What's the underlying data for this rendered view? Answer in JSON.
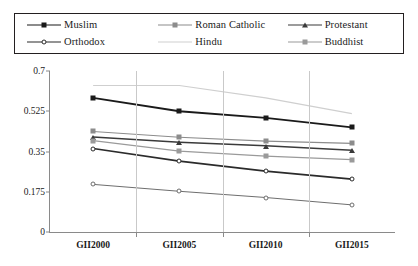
{
  "chart_data": {
    "type": "line",
    "title": "",
    "subtitle": "",
    "xlabel": "",
    "ylabel": "",
    "categories": [
      "GII2000",
      "GII2005",
      "GII2010",
      "GII2015"
    ],
    "ylim": [
      0,
      0.7
    ],
    "yticks": [
      "0",
      "0.175",
      "0.35",
      "0.525",
      "0.7"
    ],
    "ytick_values": [
      0,
      0.175,
      0.35,
      0.525,
      0.7
    ],
    "grid": "vertical-only",
    "legend_position": "top-outside",
    "series": [
      {
        "name": "Muslim",
        "color": "#1a1a1a",
        "marker": "diamond",
        "line_width": 1.9,
        "values": [
          0.583,
          0.525,
          0.496,
          0.455
        ]
      },
      {
        "name": "Roman Catholic",
        "color": "#8c8c8c",
        "marker": "square",
        "line_width": 1.2,
        "values": [
          0.437,
          0.412,
          0.395,
          0.385
        ]
      },
      {
        "name": "Protestant",
        "color": "#3a3a3a",
        "marker": "triangle",
        "line_width": 1.5,
        "values": [
          0.413,
          0.39,
          0.375,
          0.355
        ]
      },
      {
        "name": "Orthodox",
        "color": "#2b2b2b",
        "marker": "circle",
        "line_width": 1.7,
        "values": [
          0.363,
          0.308,
          0.265,
          0.23
        ]
      },
      {
        "name": "Hindu",
        "color": "#cfcfcf",
        "marker": "none",
        "line_width": 1.2,
        "values": [
          0.637,
          0.637,
          0.583,
          0.515
        ]
      },
      {
        "name": "Buddhist",
        "color": "#9a9a9a",
        "marker": "square",
        "line_width": 1.2,
        "values": [
          0.397,
          0.352,
          0.33,
          0.315
        ]
      },
      {
        "name": "",
        "color": "#6e6e6e",
        "marker": "circle",
        "line_width": 1.0,
        "values": [
          0.207,
          0.177,
          0.15,
          0.118
        ]
      }
    ]
  },
  "legend": {
    "entries": [
      {
        "label": "Muslim"
      },
      {
        "label": "Roman Catholic"
      },
      {
        "label": "Protestant"
      },
      {
        "label": "Orthodox"
      },
      {
        "label": "Hindu"
      },
      {
        "label": "Buddhist"
      }
    ]
  }
}
